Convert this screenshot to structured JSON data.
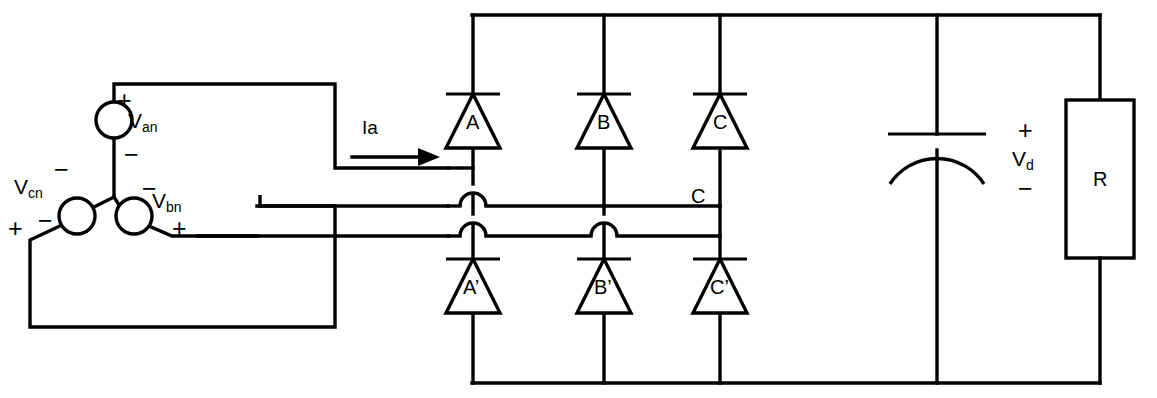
{
  "diagram": {
    "type": "circuit-schematic",
    "stroke_color": "#000000",
    "background_color": "#ffffff"
  },
  "source": {
    "topology": "wye-connected three-phase voltage source",
    "phases": [
      {
        "id": "van",
        "symbol": "V",
        "subscript": "an",
        "plus_label": "+",
        "minus_label": "−",
        "polarity_top": "+",
        "polarity_bottom": "−"
      },
      {
        "id": "vbn",
        "symbol": "V",
        "subscript": "bn",
        "plus_label": "+",
        "minus_label": "−",
        "polarity_top": "−",
        "polarity_bottom": "+"
      },
      {
        "id": "vcn",
        "symbol": "V",
        "subscript": "cn",
        "plus_label": "+",
        "minus_label": "−",
        "polarity_top": "−",
        "polarity_bottom": "+"
      }
    ]
  },
  "current": {
    "label": "Ia",
    "direction": "right"
  },
  "bridge": {
    "upper_diodes": [
      {
        "id": "a",
        "label": "A"
      },
      {
        "id": "b",
        "label": "B"
      },
      {
        "id": "c",
        "label": "C"
      }
    ],
    "lower_diodes": [
      {
        "id": "a_prime",
        "label": "A’"
      },
      {
        "id": "b_prime",
        "label": "B’"
      },
      {
        "id": "c_prime",
        "label": "C’"
      }
    ],
    "phase_c_node_label": "C"
  },
  "output": {
    "capacitor": {
      "type": "polarized-capacitor",
      "label": ""
    },
    "dc_voltage": {
      "symbol": "V",
      "subscript": "d",
      "plus_label": "+",
      "minus_label": "−"
    },
    "load": {
      "label": "R",
      "type": "resistor"
    }
  }
}
